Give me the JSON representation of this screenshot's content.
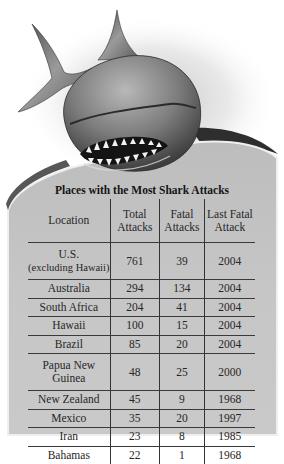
{
  "figure": {
    "image": "shark-illustration",
    "title": "Places with the Most Shark Attacks"
  },
  "table": {
    "headers": [
      {
        "line1": "Location",
        "line2": ""
      },
      {
        "line1": "Total",
        "line2": "Attacks"
      },
      {
        "line1": "Fatal",
        "line2": "Attacks"
      },
      {
        "line1": "Last Fatal",
        "line2": "Attack"
      }
    ],
    "rows": [
      {
        "location": "U.S.",
        "location_sub": "(excluding Hawaii)",
        "total": "761",
        "fatal": "39",
        "last": "2004"
      },
      {
        "location": "Australia",
        "location_sub": "",
        "total": "294",
        "fatal": "134",
        "last": "2004"
      },
      {
        "location": "South Africa",
        "location_sub": "",
        "total": "204",
        "fatal": "41",
        "last": "2004"
      },
      {
        "location": "Hawaii",
        "location_sub": "",
        "total": "100",
        "fatal": "15",
        "last": "2004"
      },
      {
        "location": "Brazil",
        "location_sub": "",
        "total": "85",
        "fatal": "20",
        "last": "2004"
      },
      {
        "location": "Papua New",
        "location_sub": "Guinea",
        "total": "48",
        "fatal": "25",
        "last": "2000"
      },
      {
        "location": "New Zealand",
        "location_sub": "",
        "total": "45",
        "fatal": "9",
        "last": "1968"
      },
      {
        "location": "Mexico",
        "location_sub": "",
        "total": "35",
        "fatal": "20",
        "last": "1997"
      },
      {
        "location": "Iran",
        "location_sub": "",
        "total": "23",
        "fatal": "8",
        "last": "1985"
      },
      {
        "location": "Bahamas",
        "location_sub": "",
        "total": "22",
        "fatal": "1",
        "last": "1968"
      }
    ]
  },
  "colors": {
    "panel": "#c4c4c4",
    "panel_edge": "#e9e9e9",
    "text": "#1a1a1a",
    "rule": "#333333"
  }
}
